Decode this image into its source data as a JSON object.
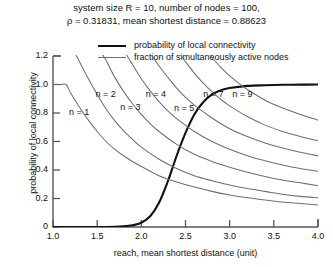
{
  "chart_data": {
    "type": "line",
    "title": "system size R = 10, number of nodes = 100, ρ = 0.31831, mean shortest distance = 0.88623",
    "title_lines": [
      "system size R = 10, number of nodes = 100,",
      "ρ = 0.31831, mean shortest distance = 0.88623"
    ],
    "xlabel": "reach, mean shortest distance (unit)",
    "ylabel": "probability of local connectivity",
    "xlim": [
      1.0,
      4.0
    ],
    "ylim": [
      0.0,
      1.2
    ],
    "xticks": [
      "1.0",
      "1.5",
      "2.0",
      "2.5",
      "3.0",
      "3.5",
      "4.0"
    ],
    "xtick_values": [
      1.0,
      1.5,
      2.0,
      2.5,
      3.0,
      3.5,
      4.0
    ],
    "yticks": [
      "0",
      "0.2",
      "0.4",
      "0.6",
      "0.8",
      "1.0",
      "1.2"
    ],
    "ytick_values": [
      0.0,
      0.2,
      0.4,
      0.6,
      0.8,
      1.0,
      1.2
    ],
    "grid": false,
    "legend_position": "top-center",
    "legend": [
      {
        "label": "probability of local connectivity",
        "style": "bold-black"
      },
      {
        "label": "fraction of simultaneously active nodes",
        "style": "thin-gray"
      }
    ],
    "series": [
      {
        "name": "probability of local connectivity",
        "style": "bold-black",
        "x": [
          1.0,
          1.2,
          1.4,
          1.6,
          1.8,
          1.9,
          2.0,
          2.1,
          2.2,
          2.3,
          2.4,
          2.5,
          2.6,
          2.7,
          2.8,
          2.9,
          3.0,
          3.2,
          3.4,
          3.6,
          3.8,
          4.0
        ],
        "y": [
          0.0,
          0.0,
          0.0,
          0.0,
          0.005,
          0.012,
          0.03,
          0.075,
          0.17,
          0.32,
          0.5,
          0.66,
          0.79,
          0.875,
          0.93,
          0.96,
          0.975,
          0.99,
          0.995,
          0.998,
          0.999,
          1.0
        ]
      },
      {
        "name": "n = 1",
        "style": "thin-gray",
        "x": [
          1.0,
          1.1,
          1.15,
          1.2,
          1.3,
          1.4,
          1.5,
          1.6,
          1.7,
          1.8,
          1.9,
          2.0,
          2.2,
          2.4,
          2.6,
          2.8,
          3.0,
          3.2,
          3.4,
          3.6,
          3.8,
          4.0
        ],
        "y": [
          1.0,
          1.0,
          1.0,
          0.94,
          0.84,
          0.75,
          0.67,
          0.6,
          0.545,
          0.5,
          0.46,
          0.425,
          0.36,
          0.315,
          0.28,
          0.25,
          0.225,
          0.205,
          0.19,
          0.175,
          0.165,
          0.155
        ]
      },
      {
        "name": "n = 2",
        "style": "thin-gray",
        "x": [
          1.25,
          1.3,
          1.4,
          1.5,
          1.6,
          1.7,
          1.8,
          1.9,
          2.0,
          2.2,
          2.4,
          2.6,
          2.8,
          3.0,
          3.2,
          3.4,
          3.6,
          3.8,
          4.0
        ],
        "y": [
          1.22,
          1.16,
          1.04,
          0.93,
          0.83,
          0.745,
          0.675,
          0.615,
          0.56,
          0.475,
          0.41,
          0.36,
          0.325,
          0.295,
          0.27,
          0.25,
          0.23,
          0.215,
          0.205
        ]
      },
      {
        "name": "n = 3",
        "style": "thin-gray",
        "x": [
          1.55,
          1.6,
          1.7,
          1.8,
          1.9,
          2.0,
          2.1,
          2.2,
          2.4,
          2.6,
          2.8,
          3.0,
          3.2,
          3.4,
          3.6,
          3.8,
          4.0
        ],
        "y": [
          1.22,
          1.17,
          1.05,
          0.95,
          0.865,
          0.79,
          0.725,
          0.67,
          0.58,
          0.51,
          0.46,
          0.42,
          0.385,
          0.355,
          0.33,
          0.31,
          0.29
        ]
      },
      {
        "name": "n = 4",
        "style": "thin-gray",
        "x": [
          1.82,
          1.9,
          2.0,
          2.1,
          2.2,
          2.3,
          2.4,
          2.6,
          2.8,
          3.0,
          3.2,
          3.4,
          3.6,
          3.8,
          4.0
        ],
        "y": [
          1.22,
          1.14,
          1.04,
          0.955,
          0.88,
          0.815,
          0.76,
          0.67,
          0.6,
          0.545,
          0.5,
          0.465,
          0.435,
          0.41,
          0.39
        ]
      },
      {
        "name": "n = 5",
        "style": "thin-gray",
        "x": [
          2.1,
          2.2,
          2.3,
          2.4,
          2.5,
          2.6,
          2.8,
          3.0,
          3.2,
          3.4,
          3.6,
          3.8,
          4.0
        ],
        "y": [
          1.22,
          1.13,
          1.05,
          0.975,
          0.91,
          0.855,
          0.765,
          0.69,
          0.635,
          0.59,
          0.555,
          0.525,
          0.5
        ]
      },
      {
        "name": "n = 7",
        "style": "thin-gray",
        "x": [
          2.43,
          2.5,
          2.6,
          2.7,
          2.8,
          2.9,
          3.0,
          3.2,
          3.4,
          3.6,
          3.8,
          4.0
        ],
        "y": [
          1.22,
          1.16,
          1.08,
          1.01,
          0.95,
          0.895,
          0.85,
          0.775,
          0.715,
          0.67,
          0.635,
          0.605
        ]
      },
      {
        "name": "n = 9",
        "style": "thin-gray",
        "x": [
          2.76,
          2.8,
          2.9,
          3.0,
          3.1,
          3.2,
          3.4,
          3.6,
          3.8,
          4.0
        ],
        "y": [
          1.22,
          1.19,
          1.12,
          1.06,
          1.01,
          0.965,
          0.89,
          0.835,
          0.79,
          0.75
        ]
      }
    ],
    "annotations": [
      {
        "text": "n = 1",
        "x": 1.18,
        "y": 0.8
      },
      {
        "text": "n = 2",
        "x": 1.48,
        "y": 0.925
      },
      {
        "text": "n = 3",
        "x": 1.76,
        "y": 0.835
      },
      {
        "text": "n = 4",
        "x": 2.05,
        "y": 0.925
      },
      {
        "text": "n = 5",
        "x": 2.37,
        "y": 0.825
      },
      {
        "text": "n = 7",
        "x": 2.7,
        "y": 0.925
      },
      {
        "text": "n = 9",
        "x": 3.03,
        "y": 0.925
      }
    ],
    "colors": {
      "primary_curve": "#111111",
      "secondary_curve": "#6e6e6e",
      "axis": "#555555",
      "text": "#111111",
      "background": "#ffffff"
    }
  }
}
